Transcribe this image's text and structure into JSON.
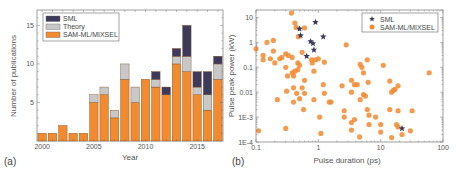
{
  "chart_data": [
    {
      "type": "bar",
      "stacked": true,
      "panel_label": "(a)",
      "title": "",
      "xlabel": "Year",
      "ylabel": "Number of publications",
      "ylim": [
        0,
        17
      ],
      "xticks": [
        "2000",
        "2005",
        "2010",
        "2015"
      ],
      "yticks": [
        "5",
        "10",
        "15"
      ],
      "categories": [
        "2000",
        "2001",
        "2002",
        "2003",
        "2004",
        "2005",
        "2006",
        "2007",
        "2008",
        "2009",
        "2010",
        "2011",
        "2012",
        "2013",
        "2014",
        "2015",
        "2016",
        "2017"
      ],
      "series": [
        {
          "name": "SAM-ML/MIXSEL",
          "color": "#f28a30",
          "values": [
            1,
            1,
            2,
            1,
            1,
            5,
            6,
            3,
            8,
            5,
            8,
            7,
            6,
            10,
            9,
            6,
            4,
            8
          ]
        },
        {
          "name": "Theory",
          "color": "#c8c8c8",
          "values": [
            0,
            0,
            0,
            0,
            0,
            1,
            1,
            1,
            2,
            2,
            0,
            1,
            0,
            1,
            2,
            1,
            2,
            2
          ]
        },
        {
          "name": "SML",
          "color": "#3d3a5c",
          "values": [
            0,
            0,
            0,
            0,
            0,
            0,
            0,
            0,
            0,
            0,
            0,
            1,
            1,
            1,
            4,
            2,
            3,
            1
          ]
        }
      ],
      "legend": [
        "SML",
        "Theory",
        "SAM-ML/MIXSEL"
      ],
      "legend_position": "upper-left",
      "grid": false
    },
    {
      "type": "scatter",
      "panel_label": "(b)",
      "title": "",
      "xlabel": "Pulse duration (ps)",
      "ylabel": "Pulse peak power (kW)",
      "xscale": "log",
      "yscale": "log",
      "xlim": [
        0.1,
        100
      ],
      "ylim": [
        0.0001,
        20
      ],
      "xticks": [
        "0.1",
        "1",
        "10",
        "100"
      ],
      "yticks": [
        "1E-4",
        "1E-3",
        "0.01",
        "0.1",
        "1",
        "10"
      ],
      "legend": [
        "SML",
        "SAM-ML/MIXSEL"
      ],
      "legend_position": "upper-right",
      "grid": false,
      "series": [
        {
          "name": "SML",
          "marker": "star",
          "color": "#3d3a5c",
          "points": [
            [
              0.5,
              3.5
            ],
            [
              0.52,
              1.9
            ],
            [
              0.9,
              6.5
            ],
            [
              0.75,
              1.1
            ],
            [
              0.82,
              0.9
            ],
            [
              1.2,
              1.7
            ],
            [
              0.85,
              0.5
            ],
            [
              0.65,
              0.28
            ],
            [
              22,
              0.00035
            ]
          ]
        },
        {
          "name": "SAM-ML/MIXSEL",
          "marker": "circle",
          "color": "#f28a30",
          "points": [
            [
              0.37,
              15
            ],
            [
              0.42,
              6
            ],
            [
              0.44,
              4
            ],
            [
              0.6,
              3.8
            ],
            [
              0.48,
              1.7
            ],
            [
              0.1,
              0.55
            ],
            [
              0.15,
              1.0
            ],
            [
              0.19,
              1.2
            ],
            [
              0.13,
              0.3
            ],
            [
              0.13,
              0.2
            ],
            [
              0.17,
              0.22
            ],
            [
              0.19,
              0.45
            ],
            [
              0.2,
              0.15
            ],
            [
              0.24,
              0.22
            ],
            [
              0.26,
              0.25
            ],
            [
              0.3,
              0.35
            ],
            [
              0.33,
              0.3
            ],
            [
              0.38,
              0.25
            ],
            [
              0.55,
              0.4
            ],
            [
              0.47,
              0.15
            ],
            [
              0.78,
              0.2
            ],
            [
              0.8,
              0.15
            ],
            [
              1.0,
              0.22
            ],
            [
              1.25,
              0.16
            ],
            [
              0.3,
              0.1
            ],
            [
              0.32,
              0.045
            ],
            [
              0.38,
              0.06
            ],
            [
              0.42,
              0.07
            ],
            [
              0.47,
              0.08
            ],
            [
              0.6,
              0.03
            ],
            [
              0.4,
              0.045
            ],
            [
              0.5,
              0.12
            ],
            [
              0.85,
              0.07
            ],
            [
              0.9,
              0.2
            ],
            [
              0.31,
              0.011
            ],
            [
              0.4,
              0.015
            ],
            [
              0.45,
              0.009
            ],
            [
              0.55,
              0.015
            ],
            [
              0.6,
              0.009
            ],
            [
              0.22,
              0.005
            ],
            [
              0.4,
              0.004
            ],
            [
              0.5,
              0.0055
            ],
            [
              0.85,
              0.005
            ],
            [
              1.2,
              0.02
            ],
            [
              1.25,
              0.009
            ],
            [
              1.5,
              0.004
            ],
            [
              1.6,
              0.004
            ],
            [
              0.58,
              0.002
            ],
            [
              1.05,
              0.001
            ],
            [
              0.11,
              0.00028
            ],
            [
              0.3,
              0.00035
            ],
            [
              1.1,
              0.00022
            ],
            [
              2.8,
              0.8
            ],
            [
              4.7,
              0.13
            ],
            [
              5.0,
              0.1
            ],
            [
              6.1,
              0.2
            ],
            [
              5.3,
              0.06
            ],
            [
              11,
              0.12
            ],
            [
              3.4,
              0.03
            ],
            [
              3.8,
              0.02
            ],
            [
              4.2,
              0.02
            ],
            [
              2.4,
              0.018
            ],
            [
              3.4,
              0.01
            ],
            [
              4.7,
              0.005
            ],
            [
              5.3,
              0.008
            ],
            [
              5.7,
              0.007
            ],
            [
              6.3,
              0.025
            ],
            [
              14,
              0.028
            ],
            [
              15,
              0.01
            ],
            [
              16,
              0.012
            ],
            [
              17,
              0.013
            ],
            [
              19,
              0.018
            ],
            [
              60,
              0.06
            ],
            [
              2.6,
              0.0018
            ],
            [
              2.6,
              0.001
            ],
            [
              3.4,
              0.0006
            ],
            [
              3.8,
              0.0008
            ],
            [
              6.1,
              0.002
            ],
            [
              6.5,
              0.0012
            ],
            [
              8.3,
              0.001
            ],
            [
              10,
              0.0005
            ],
            [
              6.5,
              0.0005
            ],
            [
              14,
              0.002
            ],
            [
              19,
              0.0018
            ],
            [
              18,
              0.0005
            ],
            [
              19,
              0.0004
            ],
            [
              32,
              0.0018
            ],
            [
              3.4,
              0.0003
            ],
            [
              4.6,
              0.00016
            ],
            [
              10,
              0.00025
            ],
            [
              15,
              0.00015
            ],
            [
              22,
              0.0002
            ],
            [
              30,
              0.00028
            ]
          ]
        }
      ]
    }
  ]
}
